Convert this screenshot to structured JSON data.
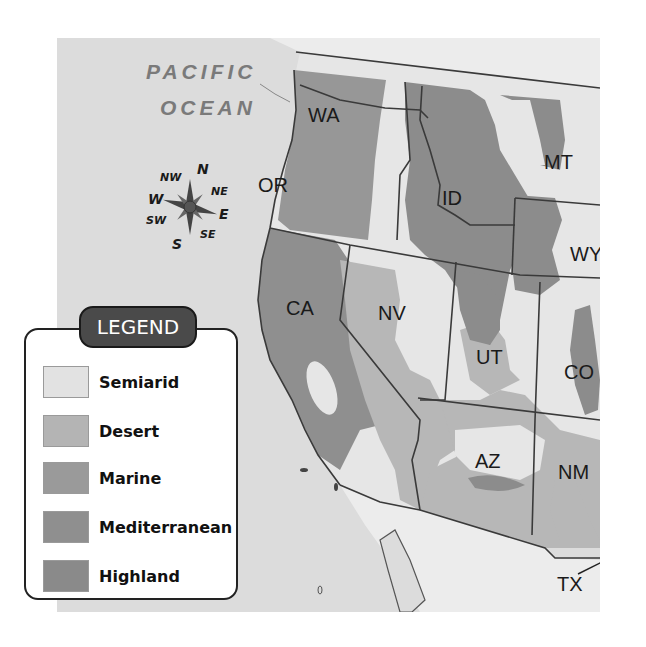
{
  "map": {
    "ocean_label": [
      "PACIFIC",
      "OCEAN"
    ],
    "states": [
      {
        "abbr": "WA",
        "x": 308,
        "y": 104
      },
      {
        "abbr": "OR",
        "x": 258,
        "y": 174
      },
      {
        "abbr": "ID",
        "x": 442,
        "y": 187
      },
      {
        "abbr": "MT",
        "x": 544,
        "y": 151
      },
      {
        "abbr": "WY",
        "x": 570,
        "y": 243
      },
      {
        "abbr": "CA",
        "x": 286,
        "y": 297
      },
      {
        "abbr": "NV",
        "x": 378,
        "y": 302
      },
      {
        "abbr": "UT",
        "x": 476,
        "y": 346
      },
      {
        "abbr": "CO",
        "x": 564,
        "y": 361
      },
      {
        "abbr": "AZ",
        "x": 475,
        "y": 450
      },
      {
        "abbr": "NM",
        "x": 558,
        "y": 461
      },
      {
        "abbr": "TX",
        "x": 557,
        "y": 573
      }
    ],
    "compass": {
      "directions": [
        "N",
        "NE",
        "E",
        "SE",
        "S",
        "SW",
        "W",
        "NW"
      ]
    }
  },
  "legend": {
    "title": "LEGEND",
    "items": [
      {
        "label": "Semiarid",
        "color": "#e2e2e2"
      },
      {
        "label": "Desert",
        "color": "#b4b4b4"
      },
      {
        "label": "Marine",
        "color": "#9a9a9a"
      },
      {
        "label": "Mediterranean",
        "color": "#8f8f8f"
      },
      {
        "label": "Highland",
        "color": "#8a8a8a"
      }
    ]
  },
  "colors": {
    "ocean": "#dcdcdc",
    "semiarid": "#e6e6e6",
    "desert": "#b7b7b7",
    "marine": "#979797",
    "mediterranean": "#8f8f8f",
    "highland": "#8c8c8c",
    "mexico": "#ececec",
    "border": "#3a3a3a"
  }
}
